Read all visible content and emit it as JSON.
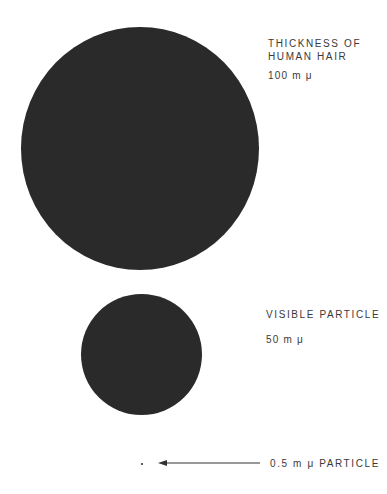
{
  "items": [
    {
      "label": "THICKNESS OF\nHUMAN HAIR",
      "value": "100 m μ"
    },
    {
      "label": "VISIBLE PARTICLE",
      "value": "50 m μ"
    },
    {
      "label": "0.5 m μ PARTICLE"
    }
  ],
  "colors": {
    "circle": "#2a2a2a",
    "text": "#3a3a3a"
  }
}
